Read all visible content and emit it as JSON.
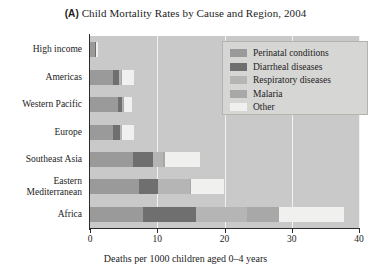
{
  "chart_data": {
    "type": "bar",
    "orientation": "horizontal",
    "stacked": true,
    "title": "Child Mortality Rates by Cause and Region, 2004",
    "panel_letter": "(A)",
    "xlabel": "Deaths per 1000 children aged 0–4 years",
    "ylabel": "",
    "xlim": [
      0,
      40
    ],
    "xticks": [
      0,
      10,
      20,
      30,
      40
    ],
    "xtick_labels": [
      "0",
      "10",
      "20",
      "30",
      "40"
    ],
    "grid": "vertical",
    "legend_position": "upper right",
    "categories": [
      "High income",
      "Americas",
      "Western Pacific",
      "Europe",
      "Southeast Asia",
      "Eastern\nMediterranean",
      "Africa"
    ],
    "series": [
      {
        "name": "Perinatal conditions",
        "color": "#9a9a9a",
        "values": [
          0.8,
          3.4,
          4.1,
          3.4,
          6.4,
          7.3,
          7.9
        ]
      },
      {
        "name": "Diarrheal diseases",
        "color": "#6f6f6f",
        "values": [
          0.05,
          0.9,
          0.6,
          1.0,
          3.0,
          2.8,
          7.9
        ]
      },
      {
        "name": "Respiratory diseases",
        "color": "#b5b5b5",
        "values": [
          0.05,
          0.3,
          0.2,
          0.3,
          1.5,
          4.8,
          7.6
        ]
      },
      {
        "name": "Malaria",
        "color": "#a8a8a8",
        "values": [
          0.0,
          0.1,
          0.1,
          0.1,
          0.2,
          0.1,
          4.7
        ]
      },
      {
        "name": "Other",
        "color": "#f0f0ee",
        "values": [
          0.3,
          1.9,
          1.2,
          1.7,
          5.2,
          5.0,
          9.6
        ]
      }
    ],
    "totals": [
      1.2,
      6.6,
      6.2,
      6.5,
      16.3,
      20.0,
      37.7
    ]
  },
  "legend": {
    "entries": [
      {
        "label": "Perinatal conditions",
        "color": "#9a9a9a"
      },
      {
        "label": "Diarrheal diseases",
        "color": "#6f6f6f"
      },
      {
        "label": "Respiratory diseases",
        "color": "#b5b5b5"
      },
      {
        "label": "Malaria",
        "color": "#a8a8a8"
      },
      {
        "label": "Other",
        "color": "#f0f0ee"
      }
    ]
  },
  "colors": {
    "plot_background": "#c9c9c9",
    "gridline": "#f2f2f2",
    "axis": "#2b2b2b",
    "text": "#1c1c1c",
    "legend_background": "#d6d6d4",
    "legend_border": "#b3b3b0"
  }
}
